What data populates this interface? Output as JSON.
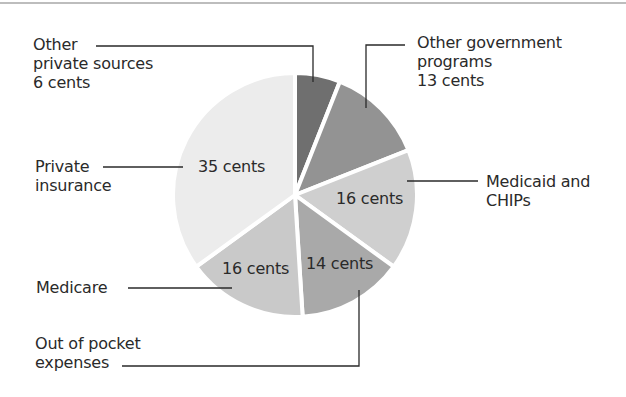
{
  "chart_data": {
    "type": "pie",
    "title": "",
    "unit": "cents",
    "start_angle_deg": 0,
    "direction": "clockwise",
    "categories": [
      "Other private sources",
      "Other government programs",
      "Medicaid and CHIPs",
      "Out of pocket expenses",
      "Medicare",
      "Private insurance"
    ],
    "values": [
      6,
      13,
      16,
      14,
      16,
      35
    ],
    "colors": [
      "#6f6f6f",
      "#939393",
      "#cfcfcf",
      "#a9a9a9",
      "#c9c9c9",
      "#ececec"
    ],
    "slice_labels": [
      "",
      "",
      "16 cents",
      "14 cents",
      "16 cents",
      "35 cents"
    ],
    "callouts": [
      {
        "category": "Other private sources",
        "text": [
          "Other",
          "private sources",
          "6 cents"
        ]
      },
      {
        "category": "Other government programs",
        "text": [
          "Other government",
          "programs",
          "13 cents"
        ]
      },
      {
        "category": "Medicaid and CHIPs",
        "text": [
          "Medicaid and",
          "CHIPs"
        ]
      },
      {
        "category": "Out of pocket expenses",
        "text": [
          "Out of pocket",
          "expenses"
        ]
      },
      {
        "category": "Medicare",
        "text": [
          "Medicare"
        ]
      },
      {
        "category": "Private insurance",
        "text": [
          "Private",
          "insurance"
        ]
      }
    ],
    "legend": "none"
  },
  "labels": {
    "other_private": "Other\nprivate sources\n6 cents",
    "other_gov": "Other government\nprograms\n13 cents",
    "medicaid": "Medicaid and\nCHIPs",
    "out_of_pocket": "Out of pocket\nexpenses",
    "medicare": "Medicare",
    "private_insurance": "Private\ninsurance",
    "slice_medicaid": "16 cents",
    "slice_out_of_pocket": "14 cents",
    "slice_medicare": "16 cents",
    "slice_private": "35 cents"
  }
}
